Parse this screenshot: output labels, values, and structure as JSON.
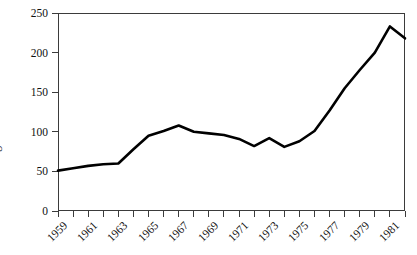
{
  "chart_data": {
    "type": "line",
    "title": "",
    "subtitle": "",
    "xlabel": "",
    "ylabel": "Rig count",
    "xlim": [
      1959,
      1982
    ],
    "ylim": [
      0,
      250
    ],
    "grid": false,
    "legend": null,
    "y_ticks": [
      250,
      200,
      150,
      100,
      50,
      0
    ],
    "x_ticks": [
      1959,
      1960,
      1961,
      1962,
      1963,
      1964,
      1965,
      1966,
      1967,
      1968,
      1969,
      1970,
      1971,
      1972,
      1973,
      1974,
      1975,
      1976,
      1977,
      1978,
      1979,
      1980,
      1981,
      1982
    ],
    "x_tick_labels": [
      "1959",
      "",
      "1961",
      "",
      "1963",
      "",
      "1965",
      "",
      "1967",
      "",
      "1969",
      "",
      "1971",
      "",
      "1973",
      "",
      "1975",
      "",
      "1977",
      "",
      "1979",
      "",
      "1981",
      ""
    ],
    "x": [
      1959,
      1960,
      1961,
      1962,
      1963,
      1964,
      1965,
      1966,
      1967,
      1968,
      1969,
      1970,
      1971,
      1972,
      1973,
      1974,
      1975,
      1976,
      1977,
      1978,
      1979,
      1980,
      1981,
      1982
    ],
    "values": [
      51,
      54,
      57,
      59,
      60,
      78,
      95,
      101,
      108,
      100,
      98,
      96,
      91,
      82,
      92,
      81,
      88,
      101,
      127,
      155,
      178,
      200,
      233,
      218
    ],
    "series": [
      {
        "name": "Rig count",
        "color": "#000000",
        "line_width": 2.6,
        "values": [
          51,
          54,
          57,
          59,
          60,
          78,
          95,
          101,
          108,
          100,
          98,
          96,
          91,
          82,
          92,
          81,
          88,
          101,
          127,
          155,
          178,
          200,
          233,
          218
        ]
      }
    ]
  },
  "axes": {
    "y_axis_title": "Rig count",
    "y_tick_labels": [
      "250",
      "200",
      "150",
      "100",
      "50",
      "0"
    ],
    "x_tick_labels_visible": [
      "1959",
      "1961",
      "1963",
      "1965",
      "1967",
      "1969",
      "1971",
      "1973",
      "1975",
      "1977",
      "1979",
      "1981"
    ]
  },
  "colors": {
    "line": "#000000",
    "axis": "#3b3b3b",
    "text": "#111111",
    "background": "#ffffff"
  }
}
